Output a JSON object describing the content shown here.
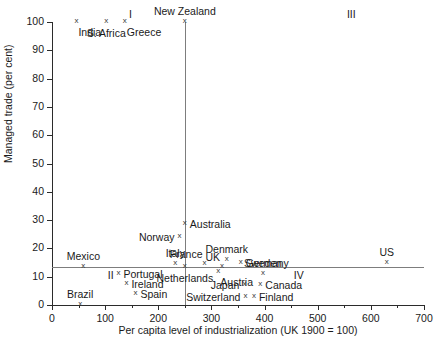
{
  "chart_data": {
    "type": "scatter",
    "title": "",
    "xlabel": "Per capita level of industrialization (UK 1900 = 100)",
    "ylabel": "Managed trade (per cent)",
    "xlim": [
      0,
      700
    ],
    "ylim": [
      0,
      100
    ],
    "xticks": [
      0,
      100,
      200,
      300,
      400,
      500,
      600,
      700
    ],
    "xtick_labels": [
      "0",
      "100",
      "200",
      "300",
      "400",
      "500",
      "600",
      "700"
    ],
    "xticks_minor": [
      50,
      150,
      250,
      350,
      450,
      550,
      650
    ],
    "yticks": [
      0,
      10,
      20,
      30,
      40,
      50,
      60,
      70,
      80,
      90,
      100
    ],
    "ytick_labels": [
      "0",
      "10",
      "20",
      "30",
      "40",
      "50",
      "60",
      "70",
      "80",
      "90",
      "100"
    ],
    "grid": false,
    "legend": "none",
    "marker": "x",
    "reference_lines": [
      {
        "name": "vertical-divider",
        "orientation": "vertical",
        "value": 250
      },
      {
        "name": "horizontal-divider",
        "orientation": "horizontal",
        "value": 13.5
      }
    ],
    "quadrant_labels": [
      {
        "name": "I",
        "text": "I",
        "x": 145,
        "y": 103
      },
      {
        "name": "III",
        "text": "III",
        "x": 555,
        "y": 103
      },
      {
        "name": "II",
        "text": "II",
        "x": 105,
        "y": 10.5
      },
      {
        "name": "IV",
        "text": "IV",
        "x": 455,
        "y": 10.5
      }
    ],
    "points": [
      {
        "label": "India",
        "x": 46,
        "y": 100,
        "label_pos": "below-r"
      },
      {
        "label": "S. Africa",
        "x": 102,
        "y": 100,
        "label_pos": "below"
      },
      {
        "label": "Greece",
        "x": 137,
        "y": 100,
        "label_pos": "below-r"
      },
      {
        "label": "New Zealand",
        "x": 250,
        "y": 100,
        "label_pos": "above"
      },
      {
        "label": "Australia",
        "x": 250,
        "y": 28.5,
        "label_pos": "right"
      },
      {
        "label": "Norway",
        "x": 240,
        "y": 24,
        "label_pos": "left"
      },
      {
        "label": "Italy",
        "x": 232,
        "y": 14.5,
        "label_pos": "above"
      },
      {
        "label": "Mexico",
        "x": 59,
        "y": 13.5,
        "label_pos": "above"
      },
      {
        "label": "Netherlands",
        "x": 250,
        "y": 13.5,
        "label_pos": "below"
      },
      {
        "label": "France",
        "x": 287,
        "y": 14.5,
        "label_pos": "above-l"
      },
      {
        "label": "UK",
        "x": 320,
        "y": 13.5,
        "label_pos": "above-l"
      },
      {
        "label": "Denmark",
        "x": 329,
        "y": 16,
        "label_pos": "above"
      },
      {
        "label": "Germany",
        "x": 355,
        "y": 15,
        "label_pos": "right"
      },
      {
        "label": "Austria",
        "x": 313,
        "y": 11.5,
        "label_pos": "below-r"
      },
      {
        "label": "Sweden",
        "x": 397,
        "y": 11,
        "label_pos": "above"
      },
      {
        "label": "Canada",
        "x": 392,
        "y": 7,
        "label_pos": "right"
      },
      {
        "label": "Japan",
        "x": 362,
        "y": 7,
        "label_pos": "left"
      },
      {
        "label": "Switzerland",
        "x": 364,
        "y": 3,
        "label_pos": "left"
      },
      {
        "label": "Finland",
        "x": 380,
        "y": 3,
        "label_pos": "right"
      },
      {
        "label": "Portugal",
        "x": 125,
        "y": 11,
        "label_pos": "right"
      },
      {
        "label": "Ireland",
        "x": 140,
        "y": 7.5,
        "label_pos": "right"
      },
      {
        "label": "Spain",
        "x": 157,
        "y": 4,
        "label_pos": "right"
      },
      {
        "label": "Brazil",
        "x": 53,
        "y": 0,
        "label_pos": "above"
      },
      {
        "label": "US",
        "x": 630,
        "y": 15,
        "label_pos": "above"
      }
    ]
  },
  "figure": {
    "caption": ""
  }
}
